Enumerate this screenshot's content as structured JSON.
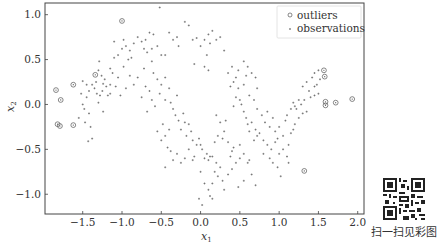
{
  "chart_data": {
    "type": "scatter",
    "title": "",
    "xlabel": "x1",
    "ylabel": "x2",
    "xlim": [
      -1.98,
      2.08
    ],
    "ylim": [
      -1.22,
      1.13
    ],
    "xticks": [
      -1.5,
      -1.0,
      -0.5,
      0.0,
      0.5,
      1.0,
      1.5,
      2.0
    ],
    "xtick_labels": [
      "−1.5",
      "−1.0",
      "−0.5",
      "0.0",
      "0.5",
      "1.0",
      "1.5",
      "2.0"
    ],
    "yticks": [
      -1.0,
      -0.5,
      0.0,
      0.5,
      1.0
    ],
    "ytick_labels": [
      "−1.0",
      "−0.5",
      "0.0",
      "0.5",
      "1.0"
    ],
    "grid": false,
    "legend": {
      "position": "upper right",
      "entries": [
        {
          "label": "outliers",
          "marker": "open-circle-with-dot"
        },
        {
          "label": "observations",
          "marker": "small-plus"
        }
      ]
    },
    "series": [
      {
        "name": "outliers",
        "points": [
          [
            -1.84,
            0.16
          ],
          [
            -1.78,
            0.05
          ],
          [
            -1.62,
            0.22
          ],
          [
            -1.34,
            0.33
          ],
          [
            -1.0,
            0.93
          ],
          [
            -1.82,
            -0.22
          ],
          [
            -1.79,
            -0.24
          ],
          [
            -1.62,
            -0.23
          ],
          [
            1.57,
            0.38
          ],
          [
            1.58,
            0.31
          ],
          [
            1.59,
            0.03
          ],
          [
            1.59,
            -0.01
          ],
          [
            1.72,
            0.02
          ],
          [
            1.93,
            0.06
          ],
          [
            1.32,
            -0.74
          ]
        ]
      },
      {
        "name": "observations",
        "points": [
          [
            -1.5,
            0.0
          ],
          [
            -1.48,
            -0.05
          ],
          [
            -1.45,
            0.08
          ],
          [
            -1.42,
            -0.1
          ],
          [
            -1.52,
            0.12
          ],
          [
            -1.47,
            -0.2
          ],
          [
            -1.4,
            -0.25
          ],
          [
            -1.55,
            -0.15
          ],
          [
            -1.38,
            -0.38
          ],
          [
            -1.43,
            -0.41
          ],
          [
            -1.3,
            0.02
          ],
          [
            -1.28,
            0.1
          ],
          [
            -1.35,
            0.18
          ],
          [
            -1.33,
            0.25
          ],
          [
            -1.25,
            0.15
          ],
          [
            -1.22,
            0.28
          ],
          [
            -1.38,
            0.22
          ],
          [
            -1.3,
            0.38
          ],
          [
            -1.2,
            0.2
          ],
          [
            -1.18,
            0.1
          ],
          [
            -1.26,
            0.32
          ],
          [
            -1.24,
            0.23
          ],
          [
            -1.15,
            0.22
          ],
          [
            -1.29,
            0.48
          ],
          [
            -1.32,
            0.12
          ],
          [
            -1.5,
            0.26
          ],
          [
            -1.45,
            0.22
          ],
          [
            -1.42,
            0.15
          ],
          [
            -1.24,
            -0.08
          ],
          [
            -1.15,
            0.12
          ],
          [
            -1.1,
            0.52
          ],
          [
            -1.05,
            0.55
          ],
          [
            -0.95,
            0.65
          ],
          [
            -0.9,
            0.6
          ],
          [
            -0.98,
            0.72
          ],
          [
            -0.85,
            0.68
          ],
          [
            -0.8,
            0.75
          ],
          [
            -0.75,
            0.7
          ],
          [
            -0.88,
            0.52
          ],
          [
            -0.92,
            0.5
          ],
          [
            -0.7,
            0.72
          ],
          [
            -0.65,
            0.8
          ],
          [
            -0.6,
            0.78
          ],
          [
            -0.55,
            0.65
          ],
          [
            -0.5,
            0.55
          ],
          [
            -0.45,
            0.55
          ],
          [
            -0.72,
            0.62
          ],
          [
            -0.62,
            0.62
          ],
          [
            -0.68,
            0.58
          ],
          [
            -0.4,
            0.8
          ],
          [
            -0.52,
            1.08
          ],
          [
            -0.35,
            0.72
          ],
          [
            -0.3,
            0.75
          ],
          [
            -0.28,
            0.65
          ],
          [
            -0.2,
            0.92
          ],
          [
            -0.15,
            0.88
          ],
          [
            -0.1,
            0.72
          ],
          [
            -0.05,
            0.74
          ],
          [
            0.0,
            0.65
          ],
          [
            0.05,
            0.72
          ],
          [
            0.1,
            0.78
          ],
          [
            0.15,
            0.82
          ],
          [
            0.2,
            0.72
          ],
          [
            0.25,
            0.75
          ],
          [
            0.3,
            0.6
          ],
          [
            0.08,
            0.55
          ],
          [
            0.12,
            0.68
          ],
          [
            0.05,
            0.42
          ],
          [
            0.1,
            0.38
          ],
          [
            -0.08,
            0.45
          ],
          [
            0.35,
            0.35
          ],
          [
            0.4,
            0.42
          ],
          [
            0.42,
            0.25
          ],
          [
            0.45,
            0.3
          ],
          [
            0.38,
            0.2
          ],
          [
            0.48,
            0.18
          ],
          [
            0.45,
            0.08
          ],
          [
            0.5,
            0.05
          ],
          [
            0.52,
            0.0
          ],
          [
            0.42,
            -0.02
          ],
          [
            0.55,
            -0.08
          ],
          [
            0.58,
            -0.15
          ],
          [
            0.6,
            -0.22
          ],
          [
            0.65,
            -0.2
          ],
          [
            0.7,
            -0.28
          ],
          [
            0.75,
            -0.32
          ],
          [
            0.62,
            -0.3
          ],
          [
            0.68,
            -0.4
          ],
          [
            0.72,
            -0.35
          ],
          [
            0.8,
            -0.4
          ],
          [
            0.85,
            -0.45
          ],
          [
            0.9,
            -0.5
          ],
          [
            0.95,
            -0.42
          ],
          [
            1.0,
            -0.55
          ],
          [
            1.05,
            -0.5
          ],
          [
            0.88,
            -0.6
          ],
          [
            0.92,
            -0.65
          ],
          [
            1.1,
            -0.58
          ],
          [
            0.98,
            -0.7
          ],
          [
            1.02,
            -0.8
          ],
          [
            1.12,
            -0.45
          ],
          [
            1.15,
            -0.32
          ],
          [
            1.2,
            -0.22
          ],
          [
            1.18,
            -0.28
          ],
          [
            1.25,
            -0.15
          ],
          [
            1.3,
            -0.1
          ],
          [
            1.22,
            -0.05
          ],
          [
            1.28,
            0.0
          ],
          [
            1.35,
            -0.08
          ],
          [
            1.32,
            0.05
          ],
          [
            1.4,
            0.08
          ],
          [
            1.45,
            0.1
          ],
          [
            1.38,
            0.15
          ],
          [
            1.5,
            0.12
          ],
          [
            1.45,
            0.2
          ],
          [
            1.42,
            0.3
          ],
          [
            1.52,
            0.28
          ],
          [
            1.48,
            0.22
          ],
          [
            1.18,
            0.02
          ],
          [
            1.2,
            -0.02
          ],
          [
            -0.6,
            0.35
          ],
          [
            -0.55,
            0.28
          ],
          [
            -0.5,
            0.22
          ],
          [
            -0.45,
            0.3
          ],
          [
            -0.52,
            0.12
          ],
          [
            -0.4,
            0.18
          ],
          [
            -0.45,
            0.05
          ],
          [
            -0.38,
            0.02
          ],
          [
            -0.3,
            0.1
          ],
          [
            -0.35,
            -0.05
          ],
          [
            -0.32,
            -0.12
          ],
          [
            -0.28,
            -0.18
          ],
          [
            -0.22,
            -0.1
          ],
          [
            -0.2,
            -0.2
          ],
          [
            -0.25,
            -0.28
          ],
          [
            -0.15,
            -0.22
          ],
          [
            -0.12,
            -0.3
          ],
          [
            -0.18,
            -0.35
          ],
          [
            -0.1,
            -0.4
          ],
          [
            -0.05,
            -0.45
          ],
          [
            -0.55,
            -0.3
          ],
          [
            -0.5,
            -0.4
          ],
          [
            -0.45,
            -0.35
          ],
          [
            -0.42,
            -0.48
          ],
          [
            -0.38,
            -0.52
          ],
          [
            -0.48,
            -0.22
          ],
          [
            -0.4,
            -0.28
          ],
          [
            -0.35,
            -0.62
          ],
          [
            -0.3,
            -0.55
          ],
          [
            -0.45,
            -0.7
          ],
          [
            -0.25,
            -0.65
          ],
          [
            -0.2,
            -0.6
          ],
          [
            -0.15,
            -0.5
          ],
          [
            -0.1,
            -0.62
          ],
          [
            -0.08,
            -0.58
          ],
          [
            0.0,
            -0.45
          ],
          [
            0.05,
            -0.6
          ],
          [
            0.02,
            -0.5
          ],
          [
            -0.02,
            -0.38
          ],
          [
            0.08,
            -0.55
          ],
          [
            0.1,
            -0.62
          ],
          [
            0.12,
            -0.58
          ],
          [
            0.15,
            -0.58
          ],
          [
            0.2,
            -0.65
          ],
          [
            0.25,
            -0.7
          ],
          [
            0.18,
            -0.75
          ],
          [
            0.22,
            -0.8
          ],
          [
            0.28,
            -0.85
          ],
          [
            0.15,
            -0.88
          ],
          [
            0.1,
            -0.95
          ],
          [
            0.12,
            -1.02
          ],
          [
            0.05,
            -0.88
          ],
          [
            0.0,
            -0.75
          ],
          [
            -0.02,
            -1.05
          ],
          [
            0.02,
            -1.12
          ],
          [
            0.15,
            -1.05
          ],
          [
            0.3,
            -0.95
          ],
          [
            0.35,
            -0.78
          ],
          [
            0.4,
            -0.72
          ],
          [
            0.45,
            -0.65
          ],
          [
            0.5,
            -0.6
          ],
          [
            0.55,
            -0.55
          ],
          [
            0.6,
            -0.65
          ],
          [
            0.65,
            -0.78
          ],
          [
            0.7,
            -0.9
          ],
          [
            0.55,
            -0.85
          ],
          [
            0.48,
            -0.92
          ],
          [
            0.62,
            -0.62
          ],
          [
            0.38,
            -0.58
          ],
          [
            0.42,
            -0.48
          ],
          [
            0.3,
            -0.3
          ],
          [
            0.25,
            -0.2
          ],
          [
            0.2,
            -0.12
          ],
          [
            0.32,
            -0.18
          ],
          [
            0.28,
            -0.38
          ],
          [
            0.35,
            -0.42
          ],
          [
            0.18,
            -0.42
          ],
          [
            0.22,
            -0.35
          ],
          [
            0.4,
            -0.52
          ],
          [
            0.5,
            -0.45
          ],
          [
            -0.7,
            0.2
          ],
          [
            -0.65,
            0.15
          ],
          [
            -0.62,
            0.05
          ],
          [
            -0.58,
            -0.02
          ],
          [
            -0.68,
            -0.08
          ],
          [
            -0.75,
            0.08
          ],
          [
            -0.8,
            0.3
          ],
          [
            -0.9,
            0.32
          ],
          [
            -0.72,
            0.4
          ],
          [
            -0.62,
            0.48
          ],
          [
            -1.05,
            0.3
          ],
          [
            -1.08,
            0.2
          ],
          [
            -1.12,
            0.35
          ],
          [
            -0.98,
            0.42
          ],
          [
            -1.02,
            0.1
          ],
          [
            -0.95,
            0.18
          ],
          [
            -0.85,
            0.22
          ],
          [
            -1.15,
            0.4
          ],
          [
            -1.0,
            0.62
          ],
          [
            -1.1,
            0.7
          ],
          [
            0.6,
            0.42
          ],
          [
            0.65,
            0.35
          ],
          [
            0.7,
            0.3
          ],
          [
            0.55,
            0.22
          ],
          [
            0.62,
            0.1
          ],
          [
            0.68,
            0.05
          ],
          [
            0.55,
            0.48
          ],
          [
            0.72,
            0.18
          ],
          [
            0.58,
            0.32
          ],
          [
            0.48,
            0.38
          ],
          [
            0.72,
            -0.05
          ],
          [
            0.78,
            -0.12
          ],
          [
            0.82,
            -0.2
          ],
          [
            0.88,
            -0.25
          ],
          [
            0.95,
            -0.3
          ],
          [
            1.0,
            -0.25
          ],
          [
            1.05,
            -0.35
          ],
          [
            1.08,
            -0.18
          ],
          [
            0.92,
            -0.15
          ],
          [
            0.85,
            -0.08
          ],
          [
            1.1,
            -0.12
          ],
          [
            1.15,
            -0.05
          ],
          [
            1.25,
            0.05
          ],
          [
            1.3,
            0.2
          ],
          [
            1.35,
            0.25
          ],
          [
            1.45,
            0.35
          ],
          [
            1.5,
            0.38
          ],
          [
            0.98,
            -0.38
          ],
          [
            1.12,
            -0.65
          ],
          [
            0.8,
            -0.55
          ]
        ]
      }
    ]
  },
  "legend": {
    "outliers_label": "outliers",
    "observations_label": "observations"
  },
  "axes": {
    "xlabel_main": "x",
    "xlabel_sub": "1",
    "ylabel_main": "x",
    "ylabel_sub": "2"
  },
  "qr": {
    "caption": "扫一扫见彩图"
  }
}
